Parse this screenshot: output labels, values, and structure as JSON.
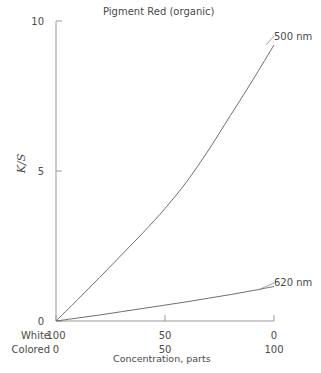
{
  "chart_data": {
    "type": "line",
    "title": "Pigment Red (organic)",
    "xlabel": "Concentration, parts",
    "ylabel": "K/S",
    "ylim": [
      0,
      10
    ],
    "yticks": [
      0,
      5,
      10
    ],
    "ytick_labels": [
      "0",
      "5",
      "10"
    ],
    "grid": false,
    "legend_position": "right-inline",
    "x_axes": [
      {
        "name": "White",
        "tick_labels": [
          "100",
          "50",
          "0"
        ],
        "values": [
          100,
          50,
          0
        ]
      },
      {
        "name": "Colored",
        "tick_labels": [
          "0",
          "50",
          "100"
        ],
        "values": [
          0,
          50,
          100
        ]
      }
    ],
    "xlim": [
      0,
      100
    ],
    "x": [
      0,
      10,
      20,
      30,
      40,
      50,
      60,
      70,
      80,
      90,
      100
    ],
    "series": [
      {
        "name": "500 nm",
        "label": "500 nm",
        "color": "#6e6e6e",
        "values": [
          0,
          0.72,
          1.45,
          2.2,
          2.95,
          3.75,
          4.65,
          5.7,
          6.85,
          8.0,
          9.2
        ]
      },
      {
        "name": "620 nm",
        "label": "620 nm",
        "color": "#6e6e6e",
        "values": [
          0,
          0.1,
          0.2,
          0.31,
          0.42,
          0.53,
          0.64,
          0.76,
          0.88,
          1.01,
          1.15
        ]
      }
    ]
  },
  "axis_colors": {
    "axis_line": "#9a9a9a",
    "curve": "#6e6e6e",
    "text": "#4a4a4a"
  }
}
